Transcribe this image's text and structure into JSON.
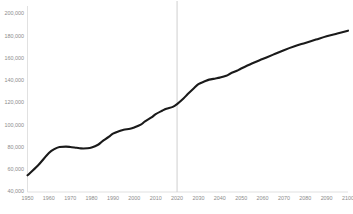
{
  "chart_data": {
    "type": "line",
    "title": "",
    "subtitle": "",
    "xlabel": "",
    "ylabel": "",
    "xlim": [
      1950,
      2100
    ],
    "ylim": [
      40000,
      200000
    ],
    "grid": false,
    "legend": null,
    "y_tick_labels": [
      "200,000",
      "180,000",
      "160,000",
      "140,000",
      "120,000",
      "100,000",
      "80,000",
      "60,000",
      "40,000"
    ],
    "y_tick_values": [
      200000,
      180000,
      160000,
      140000,
      120000,
      100000,
      80000,
      60000,
      40000
    ],
    "x_tick_labels": [
      "1950",
      "1960",
      "1970",
      "1980",
      "1990",
      "2000",
      "2010",
      "2020",
      "2030",
      "2040",
      "2050",
      "2060",
      "2070",
      "2080",
      "2090",
      "2100"
    ],
    "x_tick_values": [
      1950,
      1960,
      1970,
      1980,
      1990,
      2000,
      2010,
      2020,
      2030,
      2040,
      2050,
      2060,
      2070,
      2080,
      2090,
      2100
    ],
    "annotations": [
      {
        "name": "present-year-reference-line",
        "type": "vline",
        "x": 2020,
        "label": ""
      }
    ],
    "series": [
      {
        "name": "population",
        "color": "#1a1a1a",
        "x": [
          1950,
          1955,
          1960,
          1963,
          1965,
          1968,
          1970,
          1973,
          1975,
          1978,
          1980,
          1983,
          1985,
          1988,
          1990,
          1993,
          1995,
          1998,
          2000,
          2003,
          2005,
          2008,
          2010,
          2013,
          2015,
          2018,
          2020,
          2023,
          2025,
          2028,
          2030,
          2033,
          2035,
          2038,
          2040,
          2043,
          2045,
          2048,
          2050,
          2055,
          2060,
          2065,
          2070,
          2075,
          2080,
          2085,
          2090,
          2095,
          2100
        ],
        "y": [
          55000,
          64000,
          75000,
          79000,
          80500,
          80800,
          80500,
          79700,
          79200,
          79300,
          80000,
          82500,
          85500,
          89500,
          92500,
          94800,
          96000,
          96800,
          98000,
          100500,
          103500,
          107000,
          110000,
          113000,
          114800,
          116500,
          119000,
          124000,
          128000,
          133500,
          137000,
          139500,
          141000,
          142000,
          142800,
          144500,
          146500,
          149000,
          151000,
          155500,
          159500,
          163500,
          167500,
          171000,
          174000,
          177000,
          180000,
          182500,
          185000
        ]
      }
    ]
  },
  "axes": {
    "left_axis_name": "y-axis",
    "bottom_axis_name": "x-axis"
  }
}
